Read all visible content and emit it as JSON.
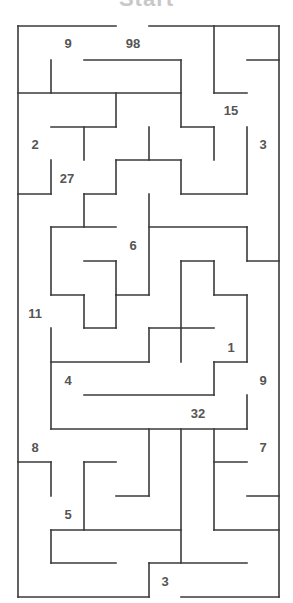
{
  "title": "Start",
  "colors": {
    "wall": "#3a3a3a",
    "label": "#555555",
    "title": "#c8c8c8"
  },
  "labels": [
    {
      "text": "9",
      "x": 68,
      "y": 43
    },
    {
      "text": "98",
      "x": 133,
      "y": 43
    },
    {
      "text": "15",
      "x": 231,
      "y": 110
    },
    {
      "text": "2",
      "x": 35,
      "y": 144
    },
    {
      "text": "3",
      "x": 263,
      "y": 144
    },
    {
      "text": "27",
      "x": 67,
      "y": 178
    },
    {
      "text": "6",
      "x": 133,
      "y": 245
    },
    {
      "text": "11",
      "x": 35,
      "y": 313
    },
    {
      "text": "1",
      "x": 231,
      "y": 347
    },
    {
      "text": "4",
      "x": 68,
      "y": 380
    },
    {
      "text": "9",
      "x": 263,
      "y": 380
    },
    {
      "text": "32",
      "x": 198,
      "y": 413
    },
    {
      "text": "8",
      "x": 35,
      "y": 447
    },
    {
      "text": "7",
      "x": 263,
      "y": 447
    },
    {
      "text": "5",
      "x": 68,
      "y": 514
    },
    {
      "text": "3",
      "x": 165,
      "y": 581
    }
  ],
  "walls": [
    [
      18,
      26,
      116,
      26
    ],
    [
      149,
      26,
      279,
      26
    ],
    [
      18,
      26,
      18,
      597
    ],
    [
      279,
      26,
      279,
      597
    ],
    [
      18,
      597,
      149,
      597
    ],
    [
      181,
      597,
      279,
      597
    ],
    [
      51,
      60,
      51,
      93
    ],
    [
      84,
      60,
      181,
      60
    ],
    [
      181,
      60,
      181,
      127
    ],
    [
      18,
      93,
      181,
      93
    ],
    [
      214,
      26,
      214,
      93
    ],
    [
      214,
      93,
      247,
      93
    ],
    [
      247,
      60,
      279,
      60
    ],
    [
      116,
      93,
      116,
      127
    ],
    [
      51,
      127,
      116,
      127
    ],
    [
      84,
      127,
      84,
      160
    ],
    [
      149,
      127,
      149,
      160
    ],
    [
      181,
      127,
      214,
      127
    ],
    [
      214,
      127,
      214,
      160
    ],
    [
      247,
      127,
      247,
      194
    ],
    [
      51,
      160,
      51,
      194
    ],
    [
      18,
      194,
      51,
      194
    ],
    [
      116,
      160,
      181,
      160
    ],
    [
      116,
      160,
      116,
      194
    ],
    [
      181,
      160,
      181,
      194
    ],
    [
      181,
      194,
      247,
      194
    ],
    [
      84,
      194,
      116,
      194
    ],
    [
      84,
      194,
      84,
      227
    ],
    [
      149,
      194,
      149,
      295
    ],
    [
      51,
      227,
      116,
      227
    ],
    [
      51,
      227,
      51,
      295
    ],
    [
      149,
      227,
      247,
      227
    ],
    [
      247,
      227,
      247,
      261
    ],
    [
      247,
      261,
      279,
      261
    ],
    [
      84,
      261,
      116,
      261
    ],
    [
      116,
      261,
      116,
      295
    ],
    [
      181,
      261,
      214,
      261
    ],
    [
      181,
      261,
      181,
      362
    ],
    [
      214,
      261,
      214,
      295
    ],
    [
      51,
      295,
      84,
      295
    ],
    [
      84,
      295,
      84,
      328
    ],
    [
      116,
      295,
      149,
      295
    ],
    [
      214,
      295,
      247,
      295
    ],
    [
      247,
      295,
      247,
      362
    ],
    [
      84,
      328,
      116,
      328
    ],
    [
      116,
      295,
      116,
      328
    ],
    [
      149,
      328,
      214,
      328
    ],
    [
      149,
      328,
      149,
      362
    ],
    [
      51,
      328,
      51,
      429
    ],
    [
      51,
      362,
      149,
      362
    ],
    [
      214,
      362,
      247,
      362
    ],
    [
      214,
      362,
      214,
      395
    ],
    [
      84,
      395,
      214,
      395
    ],
    [
      247,
      395,
      247,
      429
    ],
    [
      51,
      429,
      247,
      429
    ],
    [
      149,
      429,
      149,
      496
    ],
    [
      181,
      429,
      181,
      563
    ],
    [
      214,
      429,
      214,
      530
    ],
    [
      18,
      462,
      51,
      462
    ],
    [
      51,
      462,
      51,
      496
    ],
    [
      84,
      462,
      116,
      462
    ],
    [
      84,
      462,
      84,
      530
    ],
    [
      214,
      462,
      247,
      462
    ],
    [
      116,
      496,
      149,
      496
    ],
    [
      247,
      496,
      279,
      496
    ],
    [
      51,
      530,
      181,
      530
    ],
    [
      214,
      530,
      279,
      530
    ],
    [
      51,
      530,
      51,
      563
    ],
    [
      51,
      563,
      116,
      563
    ],
    [
      149,
      563,
      247,
      563
    ],
    [
      149,
      563,
      149,
      597
    ]
  ]
}
